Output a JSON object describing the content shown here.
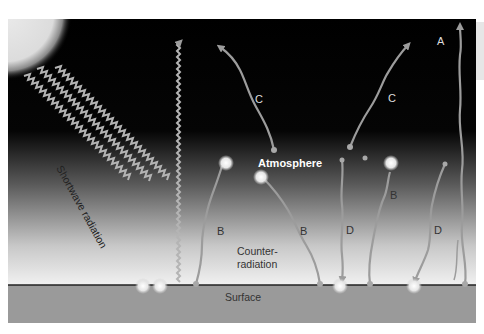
{
  "diagram": {
    "title": "",
    "labels": {
      "atmosphere": "Atmosphere",
      "surface": "Surface",
      "counter_radiation_line1": "Counter-",
      "counter_radiation_line2": "radiation",
      "shortwave": "Shortwave radiation"
    },
    "arrow_labels": {
      "a": "A",
      "b1": "B",
      "b2": "B",
      "b3": "B",
      "c1": "C",
      "c2": "C",
      "d1": "D",
      "d2": "D"
    },
    "colors": {
      "sky_top": "#000000",
      "sky_bottom": "#f2f2f2",
      "surface": "#9a9a9a",
      "surface_line": "#222222",
      "arrow": "#9c9c9c",
      "sun": "#e8e8e8",
      "text_light": "#ffffff",
      "text_dark": "#333333"
    }
  }
}
